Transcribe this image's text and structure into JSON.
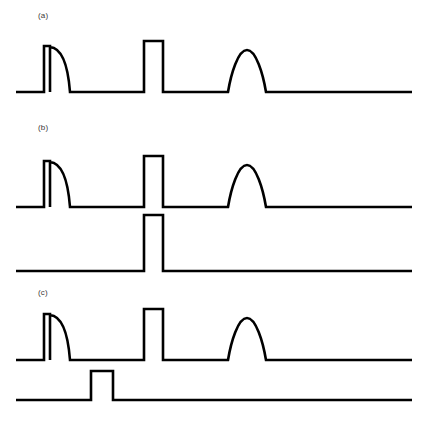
{
  "figure": {
    "type": "pulse-timing-diagram",
    "width": 428,
    "height": 435,
    "background_color": "#ffffff",
    "stroke_color": "#000000",
    "stroke_width": 2.6,
    "label_color": "#3a3a3a"
  },
  "panels": [
    {
      "id": "a",
      "label": "(a)",
      "label_x": 38,
      "label_y": 11,
      "trace_count": 1,
      "traces": [
        {
          "name": "stimulus-trace",
          "baseline_y": 92,
          "x_start": 16,
          "x_end": 412,
          "features": [
            {
              "name": "narrow-rect-pulse-with-decay",
              "shape": "rect-plus-exponential-decay",
              "rise_x": 44,
              "fall_x": 50,
              "top_y": 46,
              "decay_end_x": 70,
              "amplitude": 46
            },
            {
              "name": "wide-rect-pulse",
              "shape": "rectangle",
              "rise_x": 144,
              "fall_x": 163,
              "top_y": 41,
              "amplitude": 51
            },
            {
              "name": "dome-pulse",
              "shape": "dome",
              "start_x": 228,
              "end_x": 266,
              "peak_x": 247,
              "peak_y": 50,
              "amplitude": 42
            }
          ]
        }
      ]
    },
    {
      "id": "b",
      "label": "(b)",
      "label_x": 38,
      "label_y": 123,
      "trace_count": 2,
      "traces": [
        {
          "name": "stimulus-trace",
          "baseline_y": 207,
          "x_start": 16,
          "x_end": 412,
          "features": [
            {
              "name": "narrow-rect-pulse-with-decay",
              "shape": "rect-plus-exponential-decay",
              "rise_x": 44,
              "fall_x": 50,
              "top_y": 161,
              "decay_end_x": 70,
              "amplitude": 46
            },
            {
              "name": "wide-rect-pulse",
              "shape": "rectangle",
              "rise_x": 144,
              "fall_x": 163,
              "top_y": 156,
              "amplitude": 51
            },
            {
              "name": "dome-pulse",
              "shape": "dome",
              "start_x": 228,
              "end_x": 266,
              "peak_x": 247,
              "peak_y": 165,
              "amplitude": 42
            }
          ]
        },
        {
          "name": "gate-trace",
          "baseline_y": 271,
          "x_start": 16,
          "x_end": 412,
          "features": [
            {
              "name": "gate-rect-pulse",
              "shape": "rectangle",
              "rise_x": 144,
              "fall_x": 163,
              "top_y": 215,
              "amplitude": 56
            }
          ]
        }
      ]
    },
    {
      "id": "c",
      "label": "(c)",
      "label_x": 38,
      "label_y": 288,
      "trace_count": 2,
      "traces": [
        {
          "name": "stimulus-trace",
          "baseline_y": 360,
          "x_start": 16,
          "x_end": 412,
          "features": [
            {
              "name": "narrow-rect-pulse-with-decay",
              "shape": "rect-plus-exponential-decay",
              "rise_x": 44,
              "fall_x": 50,
              "top_y": 314,
              "decay_end_x": 70,
              "amplitude": 46
            },
            {
              "name": "wide-rect-pulse",
              "shape": "rectangle",
              "rise_x": 144,
              "fall_x": 163,
              "top_y": 309,
              "amplitude": 51
            },
            {
              "name": "dome-pulse",
              "shape": "dome",
              "start_x": 228,
              "end_x": 266,
              "peak_x": 247,
              "peak_y": 318,
              "amplitude": 42
            }
          ]
        },
        {
          "name": "gate-trace",
          "baseline_y": 400,
          "x_start": 16,
          "x_end": 412,
          "features": [
            {
              "name": "gate-rect-pulse",
              "shape": "rectangle",
              "rise_x": 91,
              "fall_x": 113,
              "top_y": 371,
              "amplitude": 29
            }
          ]
        }
      ]
    }
  ],
  "paths": {
    "panel_a_stimulus": "M 16,92 L 44,92 L 44,46 L 50,46 L 50,92 M 50,47 C 62,48 68,66 70,92 L 70,92 L 144,92 L 144,41 L 163,41 L 163,92 L 228,92 C 231,74 238,50 247,50 C 256,50 263,74 266,92 L 412,92",
    "panel_b_stimulus": "M 16,207 L 44,207 L 44,161 L 50,161 L 50,207 M 50,162 C 62,163 68,181 70,207 L 70,207 L 144,207 L 144,156 L 163,156 L 163,207 L 228,207 C 231,189 238,165 247,165 C 256,165 263,189 266,207 L 412,207",
    "panel_b_gate": "M 16,271 L 144,271 L 144,215 L 163,215 L 163,271 L 412,271",
    "panel_c_stimulus": "M 16,360 L 44,360 L 44,314 L 50,314 L 50,360 M 50,315 C 62,316 68,334 70,360 L 70,360 L 144,360 L 144,309 L 163,309 L 163,360 L 228,360 C 231,342 238,318 247,318 C 256,318 263,342 266,360 L 412,360",
    "panel_c_gate": "M 16,400 L 91,400 L 91,371 L 113,371 L 113,400 L 412,400"
  }
}
